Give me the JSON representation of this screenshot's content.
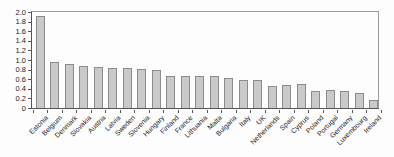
{
  "chart_data": {
    "type": "bar",
    "title": "",
    "xlabel": "",
    "ylabel": "",
    "categories": [
      "Estonia",
      "Belgium",
      "Denmark",
      "Slovakia",
      "Austria",
      "Latvia",
      "Sweden",
      "Slovenia",
      "Hungary",
      "Finland",
      "France",
      "Lithuania",
      "Malta",
      "Bulgaria",
      "Italy",
      "UK",
      "Netherlands",
      "Spain",
      "Cyprus",
      "Poland",
      "Portugal",
      "Germany",
      "Luxembourg",
      "Ireland"
    ],
    "values": [
      1.91,
      0.96,
      0.92,
      0.87,
      0.85,
      0.84,
      0.84,
      0.81,
      0.79,
      0.66,
      0.66,
      0.66,
      0.67,
      0.62,
      0.59,
      0.59,
      0.46,
      0.48,
      0.49,
      0.36,
      0.37,
      0.36,
      0.31,
      0.17
    ],
    "ylim": [
      0,
      2.0
    ],
    "ytick_step": 0.2,
    "ytick_labels": [
      "0",
      "0.2",
      "0.4",
      "0.6",
      "0.8",
      "1.0",
      "1.2",
      "1.4",
      "1.6",
      "1.8",
      "2.0"
    ],
    "grid": false,
    "legend": "none",
    "colors": {
      "bar_fill": "#cacaca",
      "bar_border": "#8c8c8c",
      "frame": "#9a9a9a",
      "axis": "#565656",
      "text": "#1c1c1c",
      "background": "#fdfdfd"
    }
  }
}
